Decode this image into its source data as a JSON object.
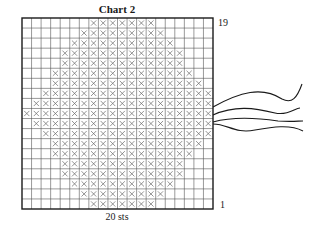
{
  "chart": {
    "title": "Chart 2",
    "top_row_label": "19",
    "bottom_row_label": "1",
    "width_label": "20 sts",
    "columns": 20,
    "rows": 19,
    "grid_color": "#555555",
    "border_color": "#1a1a1a",
    "x_color": "#666666",
    "strand_color": "#1a1a1a",
    "symbol": "x-stitch",
    "filled_ranges": [
      [
        7,
        13
      ],
      [
        6,
        14
      ],
      [
        5,
        15
      ],
      [
        4,
        16
      ],
      [
        4,
        16
      ],
      [
        3,
        17
      ],
      [
        3,
        18
      ],
      [
        2,
        19
      ],
      [
        1,
        19
      ],
      [
        0,
        19
      ],
      [
        1,
        19
      ],
      [
        2,
        19
      ],
      [
        3,
        18
      ],
      [
        3,
        17
      ],
      [
        4,
        16
      ],
      [
        4,
        16
      ],
      [
        5,
        15
      ],
      [
        6,
        14
      ],
      [
        7,
        13
      ]
    ],
    "strands": [
      "M213,107 C240,92 262,86 282,99 C292,104 297,98 302,84",
      "M213,115 C235,105 255,108 275,113 C288,116 295,108 300,108",
      "M213,122 C235,116 258,118 278,121 C292,122 298,121 303,121",
      "M213,124 C228,124 235,134 255,130 C272,127 290,124 303,131"
    ]
  }
}
